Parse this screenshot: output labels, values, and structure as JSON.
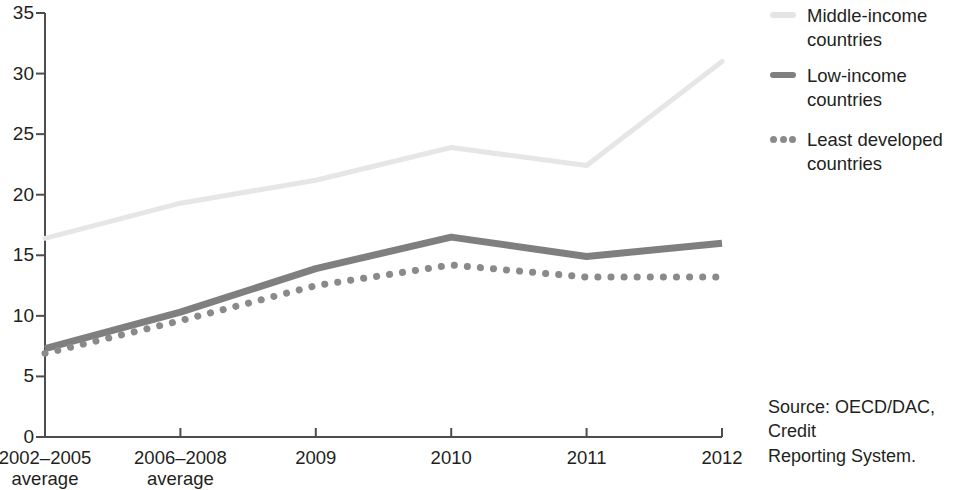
{
  "chart_data": {
    "type": "line",
    "title": "",
    "subtitle": "",
    "xlabel": "",
    "ylabel": "",
    "grid": false,
    "legend_position": "right-top",
    "categories": [
      "2002–2005\naverage",
      "2006–2008\naverage",
      "2009",
      "2010",
      "2011",
      "2012"
    ],
    "x_tick_labels": [
      "2002–2005\naverage",
      "2006–2008\naverage",
      "2009",
      "2010",
      "2011",
      "2012"
    ],
    "y_tick_labels": [
      "0",
      "5",
      "10",
      "15",
      "20",
      "25",
      "30",
      "35"
    ],
    "y_tick_values": [
      0,
      5,
      10,
      15,
      20,
      25,
      30,
      35
    ],
    "ylim": [
      0,
      35
    ],
    "series": [
      {
        "name": "Middle-income countries",
        "style": "solid-light",
        "color": "#e6e6e6",
        "values": [
          16.4,
          19.3,
          21.2,
          23.9,
          22.4,
          31.0
        ]
      },
      {
        "name": "Low-income countries",
        "style": "solid-thick",
        "color": "#7f7f7f",
        "values": [
          7.3,
          10.3,
          13.9,
          16.5,
          14.9,
          16.0
        ]
      },
      {
        "name": "Least developed countries",
        "style": "dotted",
        "color": "#8a8a8a",
        "values": [
          6.9,
          9.6,
          12.5,
          14.2,
          13.2,
          13.2
        ]
      }
    ]
  },
  "legend": {
    "items": [
      {
        "label": "Middle-income\ncountries",
        "marker": "solid-line-light",
        "color": "#e4e4e4"
      },
      {
        "label": "Low-income\ncountries",
        "marker": "solid-line-dark",
        "color": "#808080"
      },
      {
        "label": "Least developed\ncountries",
        "marker": "dotted-line-dark",
        "color": "#8a8a8a"
      }
    ]
  },
  "source": {
    "text": "Source:  OECD/DAC, Credit\nReporting System."
  },
  "axis": {
    "line_color": "#4d4d4d"
  }
}
